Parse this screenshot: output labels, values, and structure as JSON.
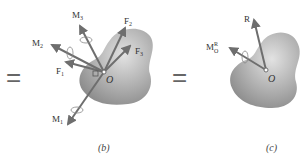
{
  "figure": {
    "equals_signs": [
      "=",
      "="
    ],
    "panel_b": {
      "caption": "(b)",
      "point_label": "O",
      "force_labels": [
        "F1",
        "F2",
        "F3"
      ],
      "moment_labels": [
        "M1",
        "M2",
        "M3"
      ]
    },
    "panel_c": {
      "caption": "(c)",
      "point_label": "O",
      "resultant_label": "R",
      "moment_label": "M",
      "moment_superscript": "R",
      "moment_subscript": "O"
    },
    "colors": {
      "arrow": "#6e6e6e",
      "body_fill": "#a9a9a9",
      "body_highlight": "#dcdcdc",
      "text": "#333333"
    }
  }
}
